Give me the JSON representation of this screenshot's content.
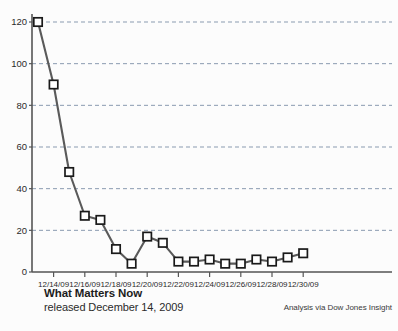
{
  "caption": {
    "title": "What Matters Now",
    "subtitle": "released December 14, 2009"
  },
  "attribution": {
    "text": "Analysis via Dow Jones Insight"
  },
  "colors": {
    "line": "#5a5a5a",
    "marker_fill": "#ffffff",
    "marker_stroke": "#1a1a1a",
    "gridline": "#8a9bb0",
    "axis": "#555555",
    "text": "#2b2b2b",
    "background": "#fcfcfc"
  },
  "chart_data": {
    "type": "line",
    "title": "",
    "subtitle": "",
    "xlabel": "",
    "ylabel": "",
    "grid": true,
    "legend": "none",
    "ylim": [
      0,
      120
    ],
    "yticks": [
      0,
      20,
      40,
      60,
      80,
      100,
      120
    ],
    "ytick_labels": [
      "0",
      "20",
      "40",
      "60",
      "80",
      "100",
      "120"
    ],
    "xticks": [
      "12/14/09",
      "12/16/09",
      "12/18/09",
      "12/20/09",
      "12/22/09",
      "12/24/09",
      "12/26/09",
      "12/28/09",
      "12/30/09"
    ],
    "xtick_labels": [
      "12/14/09",
      "12/16/09",
      "12/18/09",
      "12/20/09",
      "12/22/09",
      "12/24/09",
      "12/26/09",
      "12/28/09",
      "12/30/09"
    ],
    "x": [
      "12/13/09",
      "12/14/09",
      "12/15/09",
      "12/16/09",
      "12/17/09",
      "12/18/09",
      "12/19/09",
      "12/20/09",
      "12/21/09",
      "12/22/09",
      "12/23/09",
      "12/24/09",
      "12/25/09",
      "12/26/09",
      "12/27/09",
      "12/28/09",
      "12/29/09",
      "12/30/09"
    ],
    "values": [
      120,
      90,
      48,
      27,
      25,
      11,
      4,
      17,
      14,
      5,
      5,
      6,
      4,
      4,
      6,
      5,
      7,
      9
    ],
    "marker": "square",
    "series": [
      {
        "name": "What Matters Now mentions",
        "values": [
          120,
          90,
          48,
          27,
          25,
          11,
          4,
          17,
          14,
          5,
          5,
          6,
          4,
          4,
          6,
          5,
          7,
          9
        ]
      }
    ]
  }
}
